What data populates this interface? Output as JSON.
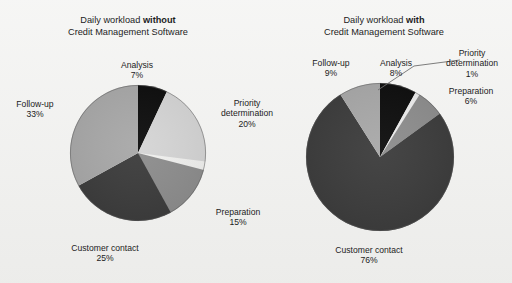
{
  "figure": {
    "background_color": "#f1f1ef",
    "text_color": "#1c1c1c"
  },
  "charts": [
    {
      "id": "without-software",
      "title_line1_prefix": "Daily workload ",
      "title_line1_emphasis": "without",
      "title_line2": "Credit Management Software",
      "labels": [
        {
          "name": "Analysis",
          "value": "7%"
        },
        {
          "name": "Priority",
          "name2": "determination",
          "value": "20%"
        },
        {
          "name": "Preparation",
          "value": "15%"
        },
        {
          "name": "Customer contact",
          "value": "25%"
        },
        {
          "name": "Follow-up",
          "value": "33%"
        }
      ]
    },
    {
      "id": "with-software",
      "title_line1_prefix": "Daily workload ",
      "title_line1_emphasis": "with",
      "title_line2": "Credit Management Software",
      "labels": [
        {
          "name": "Analysis",
          "value": "8%"
        },
        {
          "name": "Priority",
          "name2": "determination",
          "value": "1%"
        },
        {
          "name": "Preparation",
          "value": "6%"
        },
        {
          "name": "Customer contact",
          "value": "76%"
        },
        {
          "name": "Follow-up",
          "value": "9%"
        }
      ]
    }
  ],
  "chart_data": [
    {
      "type": "pie",
      "title": "Daily workload without Credit Management Software",
      "categories": [
        "Analysis",
        "Priority determination",
        "Preparation",
        "Customer contact",
        "Follow-up"
      ],
      "values": [
        7,
        20,
        15,
        25,
        33
      ],
      "value_labels": [
        "7%",
        "20%",
        "15%",
        "25%",
        "33%"
      ],
      "units": "percent",
      "start_angle_deg": 0,
      "direction": "clockwise",
      "colors": [
        "#0d0d0d",
        "#d5d5d5",
        "#8d8d8d",
        "#3c3c3c",
        "#a8a8a8"
      ],
      "legend": "none",
      "labels_position": "outside"
    },
    {
      "type": "pie",
      "title": "Daily workload with Credit Management Software",
      "categories": [
        "Analysis",
        "Priority determination",
        "Preparation",
        "Customer contact",
        "Follow-up"
      ],
      "values": [
        8,
        1,
        6,
        76,
        9
      ],
      "value_labels": [
        "8%",
        "1%",
        "6%",
        "76%",
        "9%"
      ],
      "units": "percent",
      "start_angle_deg": 0,
      "direction": "clockwise",
      "colors": [
        "#0d0d0d",
        "#ededed",
        "#8d8d8d",
        "#3c3c3c",
        "#a8a8a8"
      ],
      "legend": "none",
      "labels_position": "outside",
      "leader_lines": [
        "Priority determination"
      ]
    }
  ]
}
